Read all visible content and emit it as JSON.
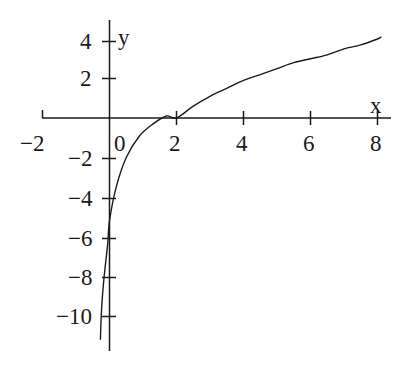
{
  "chart_data": {
    "type": "line",
    "title": "",
    "subtitle": "",
    "xlabel": "x",
    "ylabel": "y",
    "xlim": [
      -2.0,
      8.6
    ],
    "ylim": [
      -11.2,
      5.0
    ],
    "xticks": [
      -2,
      0,
      2,
      4,
      6,
      8
    ],
    "xtick_labels": [
      "−2",
      "0",
      "2",
      "4",
      "6",
      "8"
    ],
    "yticks": [
      -10,
      -8,
      -6,
      -4,
      -2,
      2,
      4
    ],
    "ytick_labels": [
      "−10",
      "−8",
      "−6",
      "−4",
      "−2",
      "2",
      "4"
    ],
    "grid": false,
    "legend": false,
    "legend_position": "none",
    "axis_style": "centered-cross",
    "series": [
      {
        "name": "logarithmic curve",
        "color": "#1a1a1a",
        "line_width": 1.4,
        "x_root": 2.0,
        "y_intercept": -5.2,
        "vertical_asymptote": -0.3,
        "x": [
          -0.27,
          -0.26,
          -0.24,
          -0.21,
          -0.17,
          -0.12,
          -0.05,
          0.0,
          0.2,
          0.5,
          0.9,
          1.3,
          1.7,
          2.0,
          2.5,
          3.0,
          3.5,
          4.0,
          4.5,
          5.0,
          5.5,
          6.0,
          6.5,
          7.0,
          7.5,
          8.0,
          8.1
        ],
        "y": [
          -11.2,
          -10.6,
          -9.8,
          -9.0,
          -8.2,
          -7.4,
          -6.3,
          -5.2,
          -3.5,
          -2.0,
          -0.9,
          -0.3,
          0.1,
          0.0,
          0.6,
          1.1,
          1.5,
          1.9,
          2.2,
          2.5,
          2.8,
          3.0,
          3.2,
          3.5,
          3.7,
          4.0,
          4.1
        ]
      }
    ],
    "annotations": []
  },
  "axes": {
    "x_axis_label": "x",
    "y_axis_label": "y"
  },
  "xtick_labels": {
    "t0": "−2",
    "t1": "0",
    "t2": "2",
    "t3": "4",
    "t4": "6",
    "t5": "8"
  },
  "ytick_labels": {
    "t0": "4",
    "t1": "2",
    "t2": "−2",
    "t3": "−4",
    "t4": "−6",
    "t5": "−8",
    "t6": "−10"
  }
}
